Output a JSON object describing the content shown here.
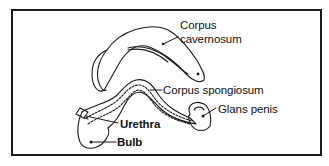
{
  "diagram": {
    "type": "anatomical-illustration",
    "labels": {
      "corpus_cavernosum_line1": "Corpus",
      "corpus_cavernosum_line2": "cavernosum",
      "corpus_spongiosum": "Corpus spongiosum",
      "glans_penis": "Glans penis",
      "urethra": "Urethra",
      "bulb": "Bulb"
    },
    "colors": {
      "stroke": "#1a1a1a",
      "background": "#ffffff"
    }
  }
}
